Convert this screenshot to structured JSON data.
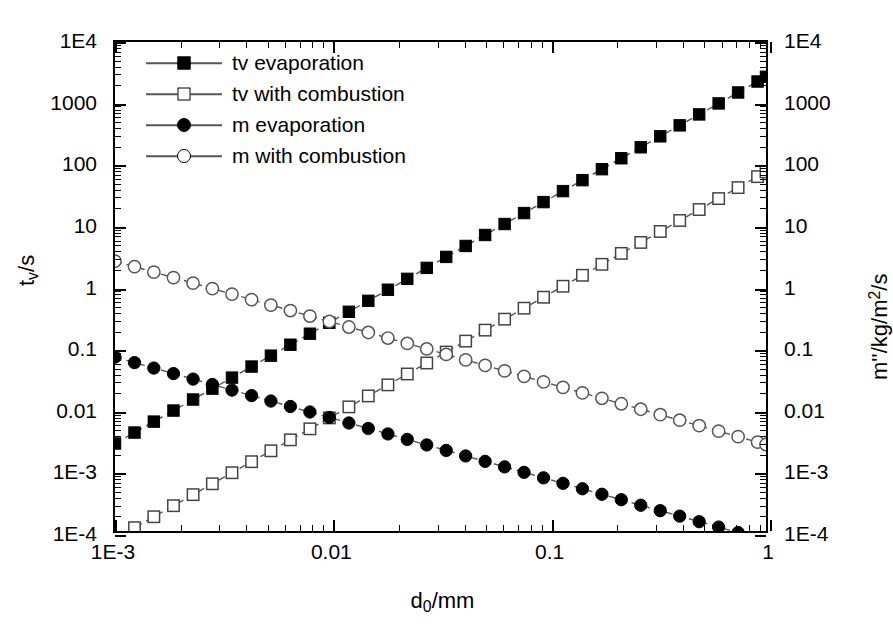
{
  "figure": {
    "background": "#ffffff",
    "ink": "#000000",
    "line_color": "#555555"
  },
  "chart_data": {
    "type": "line",
    "title": "",
    "xlabel": "d0/mm",
    "xlabel_base": "d",
    "xlabel_sub": "0",
    "xlabel_tail": "/mm",
    "ylabel_left_base": "t",
    "ylabel_left_sub": "v",
    "ylabel_left_tail": "/s",
    "ylabel_left": "tv/s",
    "ylabel_right_head": "m''/kg/m",
    "ylabel_right_sup": "2",
    "ylabel_right_tail": "/s",
    "ylabel_right": "m''/kg/m2/s",
    "xscale": "log",
    "yscale": "log",
    "xlim": [
      0.001,
      1
    ],
    "ylim": [
      0.0001,
      10000
    ],
    "ylim_right": [
      0.0001,
      10000
    ],
    "grid": false,
    "legend_position": "top-left",
    "x_ticks": [
      {
        "value": 0.001,
        "label": "1E-3"
      },
      {
        "value": 0.01,
        "label": "0.01"
      },
      {
        "value": 0.1,
        "label": "0.1"
      },
      {
        "value": 1,
        "label": "1"
      }
    ],
    "y_ticks_left": [
      {
        "value": 10000,
        "label": "1E4"
      },
      {
        "value": 1000,
        "label": "1000"
      },
      {
        "value": 100,
        "label": "100"
      },
      {
        "value": 10,
        "label": "10"
      },
      {
        "value": 1,
        "label": "1"
      },
      {
        "value": 0.1,
        "label": "0.1"
      },
      {
        "value": 0.01,
        "label": "0.01"
      },
      {
        "value": 0.001,
        "label": "1E-3"
      },
      {
        "value": 0.0001,
        "label": "1E-4"
      }
    ],
    "y_ticks_right": [
      {
        "value": 10000,
        "label": "1E4"
      },
      {
        "value": 1000,
        "label": "1000"
      },
      {
        "value": 100,
        "label": "100"
      },
      {
        "value": 10,
        "label": "10"
      },
      {
        "value": 1,
        "label": "1"
      },
      {
        "value": 0.1,
        "label": "0.1"
      },
      {
        "value": 0.01,
        "label": "0.01"
      },
      {
        "value": 0.001,
        "label": "1E-3"
      },
      {
        "value": 0.0001,
        "label": "1E-4"
      }
    ],
    "x": [
      0.001,
      0.00123,
      0.00151,
      0.00186,
      0.00229,
      0.00281,
      0.00346,
      0.00426,
      0.00523,
      0.00643,
      0.00791,
      0.00972,
      0.01196,
      0.0147,
      0.0181,
      0.02223,
      0.02733,
      0.0336,
      0.0413,
      0.05078,
      0.06243,
      0.07675,
      0.09435,
      0.116,
      0.1426,
      0.1753,
      0.2154,
      0.2648,
      0.3256,
      0.4003,
      0.4921,
      0.605,
      0.7438,
      0.9145,
      1.0
    ],
    "series": [
      {
        "name": "tv evaporation",
        "axis": "left",
        "marker": "filled-square",
        "slope": 2,
        "values": [
          0.0027,
          0.00408,
          0.00616,
          0.00934,
          0.01416,
          0.02133,
          0.03233,
          0.04899,
          0.07385,
          0.11157,
          0.16893,
          0.25511,
          0.38621,
          0.58338,
          0.88491,
          1.3341,
          2.0169,
          3.0484,
          4.6048,
          6.9617,
          10.524,
          15.901,
          24.034,
          36.341,
          54.921,
          82.985,
          125.35,
          189.35,
          286.25,
          432.65,
          653.87,
          988.38,
          1493.6,
          2257.6,
          2700.0
        ]
      },
      {
        "name": "tv with combustion",
        "axis": "left",
        "marker": "open-square",
        "slope": 2,
        "values": [
          7.5e-05,
          0.0001133,
          0.0001711,
          0.0002594,
          0.0003933,
          0.0005925,
          0.000898,
          0.0013608,
          0.0020513,
          0.0030992,
          0.0046925,
          0.0070861,
          0.0107278,
          0.0162083,
          0.0245805,
          0.0370583,
          0.0560247,
          0.0846722,
          0.1279,
          0.1933742,
          0.2923,
          0.4417,
          0.6676,
          1.0095,
          1.5256,
          2.3051,
          3.4819,
          5.2596,
          7.9511,
          12.018,
          18.163,
          27.456,
          41.488,
          62.71,
          75.0
        ]
      },
      {
        "name": "m evaporation",
        "axis": "right",
        "marker": "filled-circle",
        "slope": -1,
        "values": [
          0.07,
          0.05691,
          0.04636,
          0.03763,
          0.03056,
          0.02491,
          0.02023,
          0.01643,
          0.01338,
          0.01089,
          0.00885,
          0.0072,
          0.00585,
          0.00476,
          0.00387,
          0.00315,
          0.00256,
          0.00208,
          0.00169,
          0.00138,
          0.00112,
          0.000912,
          0.000742,
          0.000603,
          0.000491,
          0.000399,
          0.000325,
          0.000264,
          0.000215,
          0.000175,
          0.000142,
          0.000116,
          9.41e-05,
          7.66e-05,
          7e-05
        ]
      },
      {
        "name": "m with combustion",
        "axis": "right",
        "marker": "open-circle",
        "slope": -1,
        "values": [
          2.6,
          2.1138,
          1.7219,
          1.3978,
          1.1354,
          0.9253,
          0.7514,
          0.6103,
          0.4971,
          0.4044,
          0.3287,
          0.2675,
          0.2174,
          0.1769,
          0.1436,
          0.11696,
          0.09513,
          0.07738,
          0.06295,
          0.0512,
          0.04165,
          0.03388,
          0.02756,
          0.02241,
          0.018233,
          0.014832,
          0.01207,
          0.009819,
          0.007986,
          0.006495,
          0.005283,
          0.004298,
          0.003496,
          0.002843,
          0.0026
        ]
      }
    ],
    "legend": [
      {
        "label": "tv evaporation",
        "marker": "filled-square"
      },
      {
        "label": "tv with combustion",
        "marker": "open-square"
      },
      {
        "label": "m evaporation",
        "marker": "filled-circle"
      },
      {
        "label": "m with combustion",
        "marker": "open-circle"
      }
    ]
  }
}
